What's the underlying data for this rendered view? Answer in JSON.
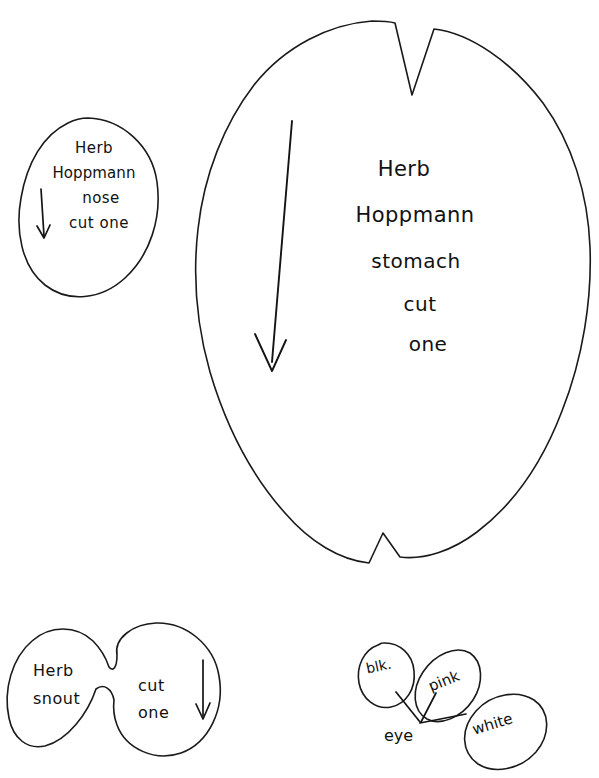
{
  "document": {
    "title": "Herb Hoppmann sewing pattern sheet",
    "background_color": "#ffffff",
    "ink_color": "#1a1a1a"
  },
  "pieces": {
    "nose": {
      "name": "nose-pattern-piece",
      "shape": "circle",
      "lines": [
        "Herb",
        "Hoppmann",
        "nose",
        "cut one"
      ],
      "grain_arrow": "down-arrow"
    },
    "stomach": {
      "name": "stomach-pattern-piece",
      "shape": "oval-with-darts",
      "lines": [
        "Herb",
        "Hoppmann",
        "stomach",
        "cut",
        "one"
      ],
      "grain_arrow": "down-arrow",
      "notches": [
        "top-v-dart",
        "bottom-v-dart"
      ]
    },
    "snout": {
      "name": "snout-pattern-piece",
      "shape": "figure-eight",
      "left_lines": [
        "Herb",
        "snout"
      ],
      "right_lines": [
        "cut",
        "one"
      ],
      "grain_arrow": "down-arrow"
    },
    "eye": {
      "name": "eye-color-key",
      "label": "eye",
      "bubbles": [
        {
          "label": "blk.",
          "name": "eye-bubble-black"
        },
        {
          "label": "pink",
          "name": "eye-bubble-pink"
        },
        {
          "label": "white",
          "name": "eye-bubble-white"
        }
      ]
    }
  }
}
